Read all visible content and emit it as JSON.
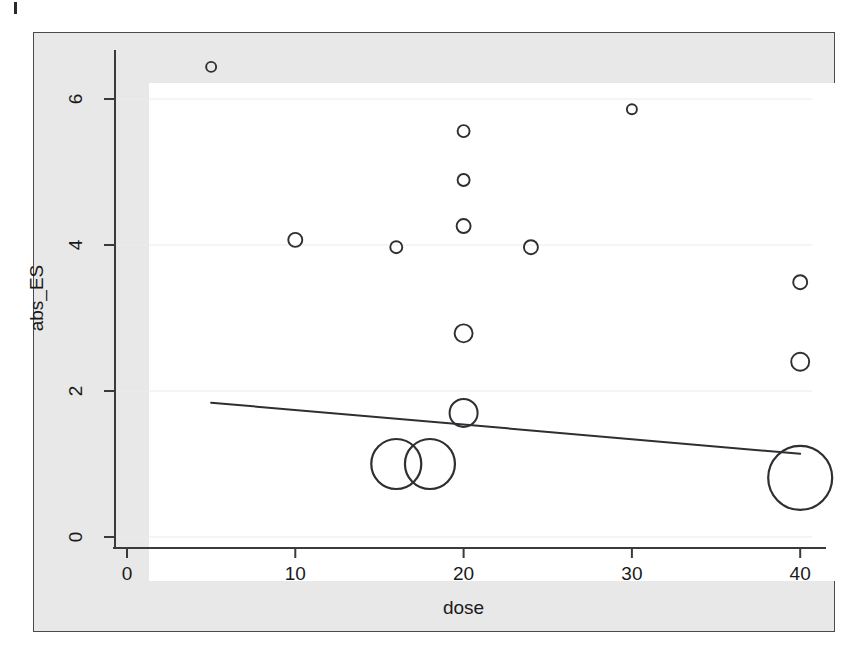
{
  "figure": {
    "panel_background": "#ffffff",
    "figure_background": "#e8e8e8",
    "frame_color": "#4a4a4a",
    "point_color": "#2e2e33",
    "line_color": "#2e2e33",
    "gridline_color": "#ebebeb"
  },
  "chart_data": {
    "type": "scatter",
    "title": "",
    "xlabel": "dose",
    "ylabel": "abs_ES",
    "xlim": [
      0,
      41
    ],
    "ylim": [
      0,
      6.6
    ],
    "xticks": [
      0,
      10,
      20,
      30,
      40
    ],
    "xtick_labels": [
      "0",
      "10",
      "20",
      "30",
      "40"
    ],
    "yticks": [
      0,
      2,
      4,
      6
    ],
    "ytick_labels": [
      "0",
      "2",
      "4",
      "6"
    ],
    "grid": true,
    "grid_axis": "y",
    "legend": "none",
    "marker": "open-circle",
    "bubble_encoding": "marker radius proportional to study weight",
    "points": [
      {
        "dose": 5,
        "abs_ES": 6.44,
        "r": 5
      },
      {
        "dose": 30,
        "abs_ES": 5.86,
        "r": 5
      },
      {
        "dose": 20,
        "abs_ES": 5.56,
        "r": 6
      },
      {
        "dose": 20,
        "abs_ES": 4.89,
        "r": 6
      },
      {
        "dose": 20,
        "abs_ES": 4.26,
        "r": 7
      },
      {
        "dose": 10,
        "abs_ES": 4.07,
        "r": 7
      },
      {
        "dose": 16,
        "abs_ES": 3.97,
        "r": 6
      },
      {
        "dose": 24,
        "abs_ES": 3.97,
        "r": 7
      },
      {
        "dose": 40,
        "abs_ES": 3.49,
        "r": 7
      },
      {
        "dose": 20,
        "abs_ES": 2.79,
        "r": 9
      },
      {
        "dose": 40,
        "abs_ES": 2.4,
        "r": 9
      },
      {
        "dose": 20,
        "abs_ES": 1.7,
        "r": 14
      },
      {
        "dose": 16,
        "abs_ES": 1.0,
        "r": 25
      },
      {
        "dose": 18,
        "abs_ES": 1.0,
        "r": 25
      },
      {
        "dose": 40,
        "abs_ES": 0.81,
        "r": 32
      }
    ],
    "regression_line": {
      "x_start": 5,
      "y_start": 1.84,
      "x_end": 40,
      "y_end": 1.14,
      "slope": -0.02,
      "intercept": 1.94
    }
  }
}
